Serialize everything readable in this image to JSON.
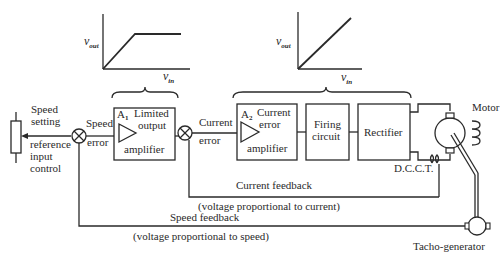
{
  "diagram": {
    "type": "block-diagram",
    "graphs": {
      "limited": {
        "ylabel": "v",
        "ysub": "out",
        "xlabel": "v",
        "xsub": "in",
        "shape": "linear-then-saturate"
      },
      "linear": {
        "ylabel": "v",
        "ysub": "out",
        "xlabel": "v",
        "xsub": "in",
        "shape": "linear"
      }
    },
    "labels": {
      "speed_setting_1": "Speed",
      "speed_setting_2": "setting",
      "reference_1": "reference",
      "reference_2": "input",
      "reference_3": "control",
      "speed_error_1": "Speed",
      "speed_error_2": "error",
      "current_error_1": "Current",
      "current_error_2": "error",
      "current_feedback": "Current feedback",
      "current_feedback_note": "(voltage proportional to current)",
      "speed_feedback": "Speed feedback",
      "speed_feedback_note": "(voltage proportional to speed)",
      "motor": "Motor",
      "dcct": "D.C.C.T.",
      "tacho": "Tacho-generator"
    },
    "blocks": {
      "a1": {
        "name": "A",
        "sub": "1",
        "line1": "Limited",
        "line2": "output",
        "line3": "amplifier"
      },
      "a2": {
        "name": "A",
        "sub": "2",
        "line1": "Current",
        "line2": "error",
        "line3": "amplifier"
      },
      "firing": {
        "line1": "Firing",
        "line2": "circuit"
      },
      "rectifier": {
        "line1": "Rectifier"
      }
    },
    "nodes": [
      "speed-setting-potentiometer",
      "speed-summing-junction",
      "A1-limited-output-amplifier",
      "current-summing-junction",
      "A2-current-error-amplifier",
      "firing-circuit",
      "rectifier",
      "motor",
      "DCCT",
      "tacho-generator"
    ],
    "edges": [
      [
        "speed-setting-potentiometer",
        "speed-summing-junction"
      ],
      [
        "speed-summing-junction",
        "A1-limited-output-amplifier"
      ],
      [
        "A1-limited-output-amplifier",
        "current-summing-junction"
      ],
      [
        "current-summing-junction",
        "A2-current-error-amplifier"
      ],
      [
        "A2-current-error-amplifier",
        "firing-circuit"
      ],
      [
        "firing-circuit",
        "rectifier"
      ],
      [
        "rectifier",
        "motor"
      ],
      [
        "DCCT",
        "current-summing-junction"
      ],
      [
        "tacho-generator",
        "speed-summing-junction"
      ]
    ]
  }
}
